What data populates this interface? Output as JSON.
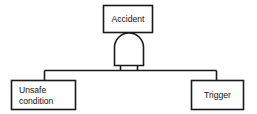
{
  "diagram": {
    "kind": "fault-tree",
    "background_color": "#ffffff",
    "line_color": "#1a1a1a",
    "text_color": "#111111",
    "top_event": {
      "label": "Accident",
      "shape": "rectangle"
    },
    "gate": {
      "type": "AND",
      "label": "",
      "shape": "and-gate-dome"
    },
    "inputs": [
      {
        "id": "unsafe-condition",
        "label_line_1": "Unsafe",
        "label_line_2": "condition",
        "shape": "rectangle",
        "align": "left"
      },
      {
        "id": "trigger",
        "label_line_1": "Trigger",
        "label_line_2": "",
        "shape": "rectangle",
        "align": "center"
      }
    ]
  }
}
